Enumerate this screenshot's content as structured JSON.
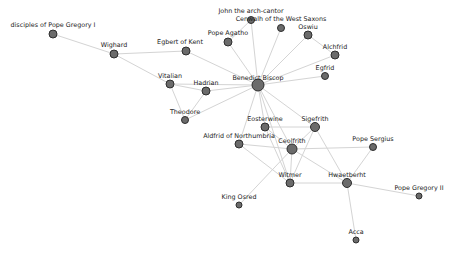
{
  "graph": {
    "title": "",
    "nodes": [
      {
        "id": "disciples",
        "label": "disciples of Pope Gregory I",
        "x": 53,
        "y": 34,
        "r": 4,
        "lx": 53,
        "ly": 27
      },
      {
        "id": "wighard",
        "label": "Wighard",
        "x": 114,
        "y": 54,
        "r": 4,
        "lx": 114,
        "ly": 47
      },
      {
        "id": "egbert",
        "label": "Egbert of Kent",
        "x": 186,
        "y": 51,
        "r": 4,
        "lx": 180,
        "ly": 44
      },
      {
        "id": "john",
        "label": "John the arch-cantor",
        "x": 251,
        "y": 20,
        "r": 3.5,
        "lx": 251,
        "ly": 13
      },
      {
        "id": "cenwalh",
        "label": "Cenwalh of the West Saxons",
        "x": 281,
        "y": 28,
        "r": 3.5,
        "lx": 281,
        "ly": 21
      },
      {
        "id": "agatho",
        "label": "Pope Agatho",
        "x": 228,
        "y": 42,
        "r": 4,
        "lx": 228,
        "ly": 35
      },
      {
        "id": "oswiu",
        "label": "Oswiu",
        "x": 308,
        "y": 35,
        "r": 4,
        "lx": 308,
        "ly": 29
      },
      {
        "id": "alchfrid",
        "label": "Alchfrid",
        "x": 335,
        "y": 55,
        "r": 4,
        "lx": 335,
        "ly": 49
      },
      {
        "id": "egfrid",
        "label": "Egfrid",
        "x": 325,
        "y": 76,
        "r": 3.5,
        "lx": 325,
        "ly": 70
      },
      {
        "id": "benedict",
        "label": "Benedict Biscop",
        "x": 258,
        "y": 85,
        "r": 6,
        "lx": 258,
        "ly": 80
      },
      {
        "id": "vitalian",
        "label": "Vitalian",
        "x": 170,
        "y": 84,
        "r": 4,
        "lx": 170,
        "ly": 78
      },
      {
        "id": "hadrian",
        "label": "Hadrian",
        "x": 206,
        "y": 91,
        "r": 4,
        "lx": 206,
        "ly": 85
      },
      {
        "id": "theodore",
        "label": "Theodore",
        "x": 185,
        "y": 120,
        "r": 3.5,
        "lx": 185,
        "ly": 114
      },
      {
        "id": "eosterwine",
        "label": "Eosterwine",
        "x": 265,
        "y": 127,
        "r": 4,
        "lx": 265,
        "ly": 121
      },
      {
        "id": "sigefrith",
        "label": "Sigefrith",
        "x": 315,
        "y": 127,
        "r": 4.5,
        "lx": 315,
        "ly": 121
      },
      {
        "id": "aldfrid",
        "label": "Aldfrid of Northumbria",
        "x": 239,
        "y": 144,
        "r": 4,
        "lx": 239,
        "ly": 138
      },
      {
        "id": "ceolfrith",
        "label": "Ceolfrith",
        "x": 292,
        "y": 149,
        "r": 5,
        "lx": 292,
        "ly": 143
      },
      {
        "id": "sergius",
        "label": "Pope Sergius",
        "x": 373,
        "y": 147,
        "r": 3.5,
        "lx": 373,
        "ly": 141
      },
      {
        "id": "witmer",
        "label": "Witmer",
        "x": 290,
        "y": 183,
        "r": 4,
        "lx": 290,
        "ly": 177
      },
      {
        "id": "hwaetberht",
        "label": "Hwaetberht",
        "x": 347,
        "y": 183,
        "r": 4.5,
        "lx": 347,
        "ly": 177
      },
      {
        "id": "gregory2",
        "label": "Pope Gregory II",
        "x": 419,
        "y": 196,
        "r": 3,
        "lx": 419,
        "ly": 190
      },
      {
        "id": "osred",
        "label": "King Osred",
        "x": 239,
        "y": 205,
        "r": 3,
        "lx": 239,
        "ly": 199
      },
      {
        "id": "acca",
        "label": "Acca",
        "x": 356,
        "y": 240,
        "r": 3,
        "lx": 356,
        "ly": 234
      }
    ],
    "edges": [
      [
        "disciples",
        "wighard"
      ],
      [
        "wighard",
        "egbert"
      ],
      [
        "wighard",
        "vitalian"
      ],
      [
        "egbert",
        "benedict"
      ],
      [
        "agatho",
        "benedict"
      ],
      [
        "agatho",
        "john"
      ],
      [
        "john",
        "benedict"
      ],
      [
        "cenwalh",
        "benedict"
      ],
      [
        "oswiu",
        "benedict"
      ],
      [
        "oswiu",
        "alchfrid"
      ],
      [
        "alchfrid",
        "benedict"
      ],
      [
        "egfrid",
        "benedict"
      ],
      [
        "vitalian",
        "benedict"
      ],
      [
        "vitalian",
        "hadrian"
      ],
      [
        "vitalian",
        "theodore"
      ],
      [
        "hadrian",
        "benedict"
      ],
      [
        "hadrian",
        "theodore"
      ],
      [
        "theodore",
        "benedict"
      ],
      [
        "benedict",
        "eosterwine"
      ],
      [
        "benedict",
        "ceolfrith"
      ],
      [
        "benedict",
        "sigefrith"
      ],
      [
        "benedict",
        "aldfrid"
      ],
      [
        "benedict",
        "witmer"
      ],
      [
        "eosterwine",
        "sigefrith"
      ],
      [
        "eosterwine",
        "ceolfrith"
      ],
      [
        "eosterwine",
        "witmer"
      ],
      [
        "sigefrith",
        "ceolfrith"
      ],
      [
        "sigefrith",
        "witmer"
      ],
      [
        "sigefrith",
        "hwaetberht"
      ],
      [
        "aldfrid",
        "ceolfrith"
      ],
      [
        "aldfrid",
        "witmer"
      ],
      [
        "ceolfrith",
        "witmer"
      ],
      [
        "ceolfrith",
        "sergius"
      ],
      [
        "ceolfrith",
        "hwaetberht"
      ],
      [
        "ceolfrith",
        "osred"
      ],
      [
        "witmer",
        "hwaetberht"
      ],
      [
        "hwaetberht",
        "sergius"
      ],
      [
        "hwaetberht",
        "gregory2"
      ],
      [
        "hwaetberht",
        "acca"
      ]
    ]
  },
  "colors": {
    "background": "#ffffff",
    "edge": "#d4d4d4",
    "node_fill": "#6b6b6b",
    "node_stroke": "#2e2e2e",
    "label": "#222222"
  }
}
